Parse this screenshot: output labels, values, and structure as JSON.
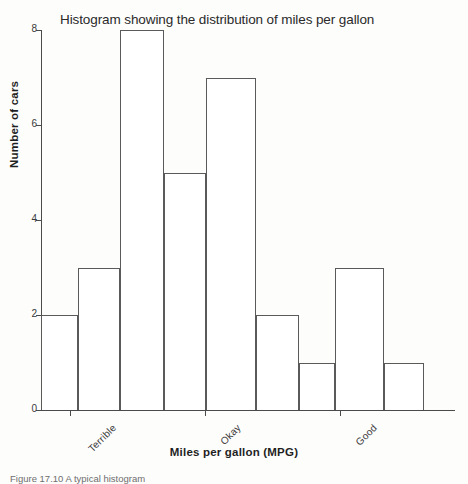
{
  "figure": {
    "caption": "Figure 17.10  A typical histogram"
  },
  "chart_data": {
    "type": "bar",
    "title": "Histogram showing the distribution of miles per gallon",
    "xlabel": "Miles per gallon (MPG)",
    "ylabel": "Number of cars",
    "ylim": [
      0,
      8
    ],
    "grid": false,
    "legend": null,
    "bar_gap": 0,
    "categories": [
      "1",
      "2",
      "3",
      "4",
      "5",
      "6",
      "7",
      "8",
      "9"
    ],
    "values": [
      2,
      3,
      8,
      5,
      7,
      2,
      1,
      3,
      1
    ],
    "bars": [
      {
        "index": 1,
        "value": 2,
        "x_start": 0,
        "x_end": 37
      },
      {
        "index": 2,
        "value": 3,
        "x_start": 37,
        "x_end": 79
      },
      {
        "index": 3,
        "value": 8,
        "x_start": 79,
        "x_end": 123
      },
      {
        "index": 4,
        "value": 5,
        "x_start": 123,
        "x_end": 165
      },
      {
        "index": 5,
        "value": 7,
        "x_start": 165,
        "x_end": 215
      },
      {
        "index": 6,
        "value": 2,
        "x_start": 215,
        "x_end": 258
      },
      {
        "index": 7,
        "value": 1,
        "x_start": 258,
        "x_end": 294
      },
      {
        "index": 8,
        "value": 3,
        "x_start": 294,
        "x_end": 343
      },
      {
        "index": 9,
        "value": 1,
        "x_start": 343,
        "x_end": 383
      }
    ],
    "yticks": [
      {
        "label": "0",
        "value": 0
      },
      {
        "label": "2",
        "value": 2
      },
      {
        "label": "4",
        "value": 4
      },
      {
        "label": "6",
        "value": 6
      },
      {
        "label": "8",
        "value": 8
      }
    ],
    "xticks": [
      {
        "label": "Terrible",
        "pos": 29
      },
      {
        "label": "Okay",
        "pos": 164
      },
      {
        "label": "Good",
        "pos": 299
      }
    ],
    "colors": {
      "bar_fill": "#ffffff",
      "bar_stroke": "#5a5a5a",
      "axis": "#4a4a4a",
      "text": "#2a2a2a",
      "background": "#fdfdfc"
    }
  }
}
